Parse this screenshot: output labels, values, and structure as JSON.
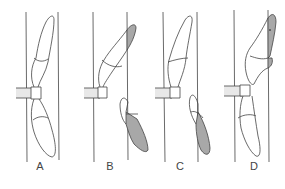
{
  "diagram": {
    "panels": [
      {
        "label": "A",
        "x": 40
      },
      {
        "label": "B",
        "x": 110
      },
      {
        "label": "C",
        "x": 180
      },
      {
        "label": "D",
        "x": 254
      }
    ],
    "colors": {
      "line": "#444444",
      "shaded": "#a8a8a8",
      "pin": "#e8e8e8",
      "background": "#ffffff"
    }
  }
}
